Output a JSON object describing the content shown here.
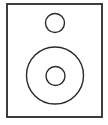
{
  "icon": {
    "name": "speaker-icon",
    "stroke_color": "#2a2a2a",
    "background": "#ffffff"
  }
}
